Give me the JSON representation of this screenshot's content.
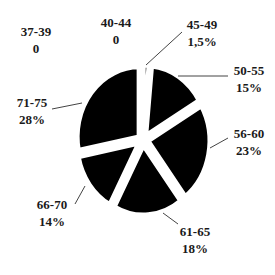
{
  "chart_data": {
    "type": "pie",
    "title": "",
    "exploded": true,
    "start_angle_deg": 0,
    "direction": "clockwise",
    "slice_color": "#000000",
    "categories": [
      "37-39",
      "40-44",
      "45-49",
      "50-55",
      "56-60",
      "61-65",
      "66-70",
      "71-75"
    ],
    "values": [
      0,
      0,
      1.5,
      15,
      23,
      18,
      14,
      28
    ],
    "value_labels": [
      "0",
      "0",
      "1,5%",
      "15%",
      "23%",
      "18%",
      "14%",
      "28%"
    ],
    "legend": "none (direct labels with leader lines)"
  },
  "labels": [
    {
      "name": "37-39",
      "value": "0"
    },
    {
      "name": "40-44",
      "value": "0"
    },
    {
      "name": "45-49",
      "value": "1,5%"
    },
    {
      "name": "50-55",
      "value": "15%"
    },
    {
      "name": "56-60",
      "value": "23%"
    },
    {
      "name": "61-65",
      "value": "18%"
    },
    {
      "name": "66-70",
      "value": "14%"
    },
    {
      "name": "71-75",
      "value": "28%"
    }
  ]
}
